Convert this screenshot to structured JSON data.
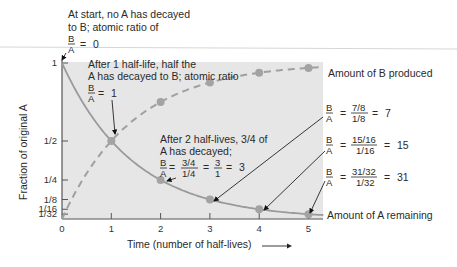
{
  "chart_data": {
    "type": "line",
    "title": "",
    "xlabel": "Time (number of half-lives)",
    "ylabel": "Fraction of original A",
    "x": [
      0,
      1,
      2,
      3,
      4,
      5
    ],
    "xticks": [
      "0",
      "1",
      "2",
      "3",
      "4",
      "5"
    ],
    "yticks": [
      {
        "label": "1",
        "value": 1
      },
      {
        "label": "1/2",
        "value": 0.5
      },
      {
        "label": "1/4",
        "value": 0.25
      },
      {
        "label": "1/8",
        "value": 0.125
      },
      {
        "label": "1/16",
        "value": 0.0625
      },
      {
        "label": "1/32",
        "value": 0.03125
      }
    ],
    "xlim": [
      0,
      5.3
    ],
    "ylim": [
      0,
      1
    ],
    "grid": false,
    "series": [
      {
        "name": "Amount of A remaining",
        "style": "solid",
        "values": [
          1,
          0.5,
          0.25,
          0.125,
          0.0625,
          0.03125
        ]
      },
      {
        "name": "Amount of B produced",
        "style": "dashed",
        "values": [
          0,
          0.5,
          0.75,
          0.875,
          0.9375,
          0.96875
        ]
      }
    ],
    "annotations": [
      {
        "id": "start",
        "lines": [
          "At start, no A has decayed",
          "to B; atomic ratio of"
        ],
        "ratio": "B/A = 0"
      },
      {
        "id": "hl1",
        "lines": [
          "After 1 half-life, half the",
          "A has decayed to B; atomic ratio"
        ],
        "ratio": "B/A = 1"
      },
      {
        "id": "hl2",
        "lines": [
          "After 2 half-lives, 3/4 of",
          "A has decayed;"
        ],
        "ratio": "B/A = 3/4 / 1/4 = 3/1 = 3"
      },
      {
        "id": "hl3",
        "ratio": "B/A = 7/8 / 1/8 = 7"
      },
      {
        "id": "hl4",
        "ratio": "B/A = 15/16 / 1/16 = 15"
      },
      {
        "id": "hl5",
        "ratio": "B/A = 31/32 / 1/32 = 31"
      }
    ]
  },
  "labels": {
    "start_line1": "At start, no A has decayed",
    "start_line2": "to B; atomic ratio of",
    "hl1_line1": "After 1 half-life, half the",
    "hl1_line2": "A has decayed to B; atomic ratio",
    "hl2_line1": "After 2 half-lives, 3/4 of",
    "hl2_line2": "A has decayed;",
    "B": "B",
    "A": "A",
    "eq": "=",
    "zero": "0",
    "one": "1",
    "r2_num": "3/4",
    "r2_den": "1/4",
    "r2_num2": "3",
    "r2_den2": "1",
    "r2_res": "3",
    "r3_num": "7/8",
    "r3_den": "1/8",
    "r3_res": "7",
    "r4_num": "15/16",
    "r4_den": "1/16",
    "r4_res": "15",
    "r5_num": "31/32",
    "r5_den": "1/32",
    "r5_res": "31",
    "legend_B": "Amount of B produced",
    "legend_A": "Amount of A remaining"
  },
  "colors": {
    "plot_bg": "#e6e6e6",
    "curve": "#9a9a9a",
    "point": "#a3a3a3",
    "axis": "#555555",
    "text": "#2a2a2a",
    "rule": "#cfcfcf"
  }
}
